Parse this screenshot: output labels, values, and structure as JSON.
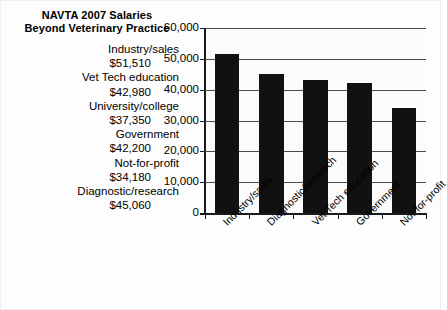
{
  "title": {
    "line1": "NAVTA 2007 Salaries",
    "line2": "Beyond Veterinary Practice"
  },
  "salary_list": [
    {
      "category": "Industry/sales",
      "amount": "$51,510"
    },
    {
      "category": "Vet Tech education",
      "amount": "$42,980"
    },
    {
      "category": "University/college",
      "amount": "$37,350"
    },
    {
      "category": "Government",
      "amount": "$42,200"
    },
    {
      "category": "Not-for-profit",
      "amount": "$34,180"
    },
    {
      "category": "Diagnostic/research",
      "amount": "$45,060"
    }
  ],
  "chart_data": {
    "type": "bar",
    "title": "NAVTA 2007 Salaries Beyond Veterinary Practice",
    "xlabel": "",
    "ylabel": "",
    "categories": [
      "Industry/sales",
      "Diagnostic/research",
      "Vet Tech education",
      "Government",
      "Not-for-profit"
    ],
    "values": [
      51510,
      45060,
      42980,
      42200,
      34180
    ],
    "ylim": [
      0,
      60000
    ],
    "yticks": [
      0,
      10000,
      20000,
      30000,
      40000,
      50000,
      60000
    ],
    "ytick_labels": [
      "0",
      "10,000",
      "20,000",
      "30,000",
      "40,000",
      "50,000",
      "60,000"
    ],
    "grid": true,
    "legend": false,
    "bar_color": "#111111",
    "xtick_rotation": -45
  }
}
